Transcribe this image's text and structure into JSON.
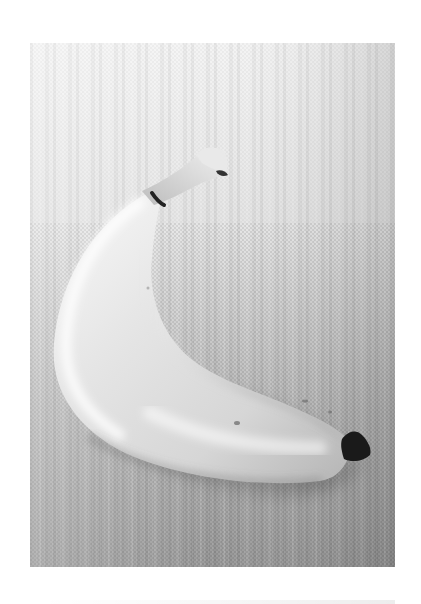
{
  "image": {
    "subject": "banana",
    "description": "Grayscale photograph of a single banana lying on a textured linen cloth, shown inside a white page margin",
    "style": "monochrome",
    "colors": {
      "page_background": "#ffffff",
      "cloth_light": "#ebebeb",
      "cloth_dark": "#8a8a8a",
      "banana_highlight": "#f7f7f7",
      "banana_shadow": "#9a9a9a",
      "banana_tip": "#1a1a1a"
    }
  },
  "caption": {
    "text": ""
  }
}
